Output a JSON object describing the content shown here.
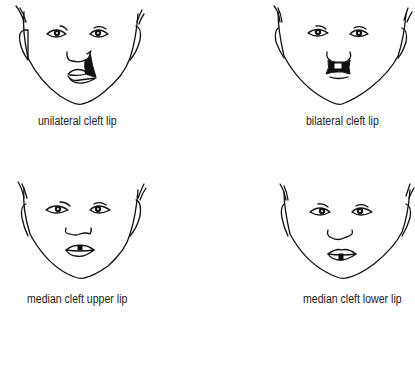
{
  "figure": {
    "panels": [
      {
        "id": "unilateral",
        "label": "unilateral cleft lip",
        "condition": "unilateral cleft lip"
      },
      {
        "id": "bilateral",
        "label": "bilateral cleft lip",
        "condition": "bilateral cleft lip"
      },
      {
        "id": "median-upper",
        "label": "median cleft upper lip",
        "condition": "median cleft upper lip"
      },
      {
        "id": "median-lower",
        "label": "median cleft lower lip",
        "condition": "median cleft lower lip"
      }
    ]
  }
}
